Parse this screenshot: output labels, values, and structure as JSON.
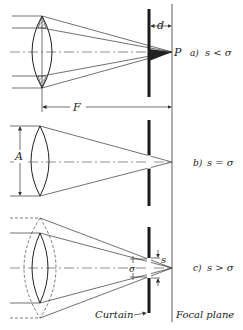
{
  "diagram": {
    "panels": [
      {
        "id": "a",
        "caption_label": "a)",
        "condition": "s < σ",
        "point_label": "P",
        "distance_label": "d",
        "focal_label": "F"
      },
      {
        "id": "b",
        "caption_label": "b)",
        "condition": "s = σ",
        "aperture_label": "A"
      },
      {
        "id": "c",
        "caption_label": "c)",
        "condition": "s > σ",
        "slit_label": "s",
        "sigma_label": "σ"
      }
    ],
    "bottom_labels": {
      "curtain": "Curtain",
      "focal_plane": "Focal plane"
    },
    "colors": {
      "ink": "#222222",
      "background": "#ffffff"
    }
  }
}
